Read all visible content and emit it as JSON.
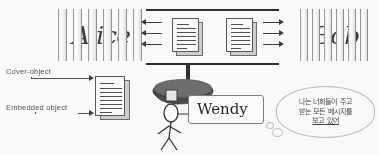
{
  "diagram": {
    "sender": {
      "name": "Alice",
      "bars": 7
    },
    "receiver": {
      "name": "Bob",
      "bars": 7
    },
    "eavesdropper": {
      "name": "Wendy",
      "icon": "police-cap-icon"
    },
    "labels": {
      "cover_object": "Cover-object",
      "embedded_object": "Embedded  object"
    },
    "thought": {
      "line1": "나는 너희들이 주고",
      "line2": "받는 모든 메시지를",
      "line3": "보고 있어"
    },
    "arrows": {
      "left_count": 3,
      "right_count": 3,
      "left_direction": "left",
      "right_direction": "right"
    },
    "documents": {
      "channel_left": "document-stack-icon",
      "channel_right": "document-stack-icon",
      "stego_object": "document-stack-icon"
    },
    "colors": {
      "ink": "#2c2c2c",
      "paper": "#fbfbfb",
      "bar_edge": "#9a9a9a",
      "cap": "#5a5a5a",
      "background": "#fdfdfc"
    }
  }
}
